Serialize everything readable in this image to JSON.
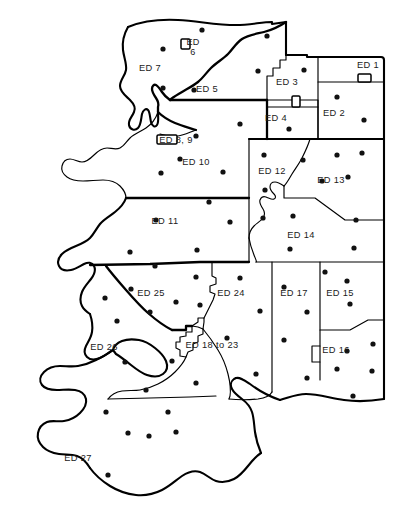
{
  "figure": {
    "type": "choropleth-outline-map",
    "width": 396,
    "height": 528,
    "background_color": "#ffffff",
    "line_color": "#000000",
    "dot_color": "#111111"
  },
  "districts": [
    {
      "id": "ed-1",
      "label": "ED 1",
      "label_x": 368,
      "label_y": 68,
      "has_inset_box": true,
      "box_x": 358,
      "box_y": 74,
      "box_w": 13,
      "box_h": 8
    },
    {
      "id": "ed-2",
      "label": "ED 2",
      "label_x": 334,
      "label_y": 116,
      "has_inset_box": false
    },
    {
      "id": "ed-3",
      "label": "ED 3",
      "label_x": 287,
      "label_y": 85,
      "has_inset_box": true,
      "box_x": 292,
      "box_y": 96,
      "box_w": 8,
      "box_h": 11
    },
    {
      "id": "ed-4",
      "label": "ED 4",
      "label_x": 276,
      "label_y": 121,
      "has_inset_box": false
    },
    {
      "id": "ed-5",
      "label": "ED 5",
      "label_x": 207,
      "label_y": 92,
      "has_inset_box": false
    },
    {
      "id": "ed-6",
      "label": "ED\n6",
      "label_x": 193,
      "label_y": 45,
      "has_inset_box": true,
      "box_x": 181,
      "box_y": 39,
      "box_w": 9,
      "box_h": 10
    },
    {
      "id": "ed-7",
      "label": "ED 7",
      "label_x": 150,
      "label_y": 71,
      "has_inset_box": false
    },
    {
      "id": "ed-8-9",
      "label": "ED 8, 9",
      "label_x": 176,
      "label_y": 143,
      "has_inset_box": true,
      "box_x": 157,
      "box_y": 135,
      "box_w": 20,
      "box_h": 9
    },
    {
      "id": "ed-10",
      "label": "ED 10",
      "label_x": 196,
      "label_y": 165,
      "has_inset_box": false
    },
    {
      "id": "ed-11",
      "label": "ED 11",
      "label_x": 165,
      "label_y": 224,
      "has_inset_box": false
    },
    {
      "id": "ed-12",
      "label": "ED 12",
      "label_x": 272,
      "label_y": 174,
      "has_inset_box": false
    },
    {
      "id": "ed-13",
      "label": "ED 13",
      "label_x": 331,
      "label_y": 183,
      "has_inset_box": false
    },
    {
      "id": "ed-14",
      "label": "ED 14",
      "label_x": 301,
      "label_y": 238,
      "has_inset_box": false
    },
    {
      "id": "ed-15",
      "label": "ED 15",
      "label_x": 340,
      "label_y": 296,
      "has_inset_box": false
    },
    {
      "id": "ed-16",
      "label": "ED 16",
      "label_x": 336,
      "label_y": 353,
      "has_inset_box": false
    },
    {
      "id": "ed-17",
      "label": "ED 17",
      "label_x": 294,
      "label_y": 296,
      "has_inset_box": false
    },
    {
      "id": "ed-18-23",
      "label": "ED 18 to 23",
      "label_x": 212,
      "label_y": 348,
      "has_inset_box": false
    },
    {
      "id": "ed-24",
      "label": "ED 24",
      "label_x": 231,
      "label_y": 296,
      "has_inset_box": false
    },
    {
      "id": "ed-25",
      "label": "ED 25",
      "label_x": 151,
      "label_y": 296,
      "has_inset_box": false
    },
    {
      "id": "ed-26",
      "label": "ED 26",
      "label_x": 104,
      "label_y": 350,
      "has_inset_box": false
    },
    {
      "id": "ed-27",
      "label": "ED 27",
      "label_x": 78,
      "label_y": 461,
      "has_inset_box": false
    }
  ],
  "settlement_dots": [
    {
      "x": 202,
      "y": 30
    },
    {
      "x": 267,
      "y": 36
    },
    {
      "x": 163,
      "y": 49
    },
    {
      "x": 258,
      "y": 71
    },
    {
      "x": 304,
      "y": 70
    },
    {
      "x": 163,
      "y": 88
    },
    {
      "x": 194,
      "y": 90
    },
    {
      "x": 337,
      "y": 97
    },
    {
      "x": 364,
      "y": 120
    },
    {
      "x": 289,
      "y": 129
    },
    {
      "x": 240,
      "y": 124
    },
    {
      "x": 196,
      "y": 136
    },
    {
      "x": 180,
      "y": 159
    },
    {
      "x": 223,
      "y": 172
    },
    {
      "x": 161,
      "y": 173
    },
    {
      "x": 264,
      "y": 155
    },
    {
      "x": 303,
      "y": 160
    },
    {
      "x": 337,
      "y": 155
    },
    {
      "x": 362,
      "y": 153
    },
    {
      "x": 265,
      "y": 190
    },
    {
      "x": 322,
      "y": 181
    },
    {
      "x": 348,
      "y": 177
    },
    {
      "x": 209,
      "y": 202
    },
    {
      "x": 156,
      "y": 220
    },
    {
      "x": 230,
      "y": 222
    },
    {
      "x": 263,
      "y": 218
    },
    {
      "x": 293,
      "y": 216
    },
    {
      "x": 356,
      "y": 220
    },
    {
      "x": 130,
      "y": 252
    },
    {
      "x": 197,
      "y": 250
    },
    {
      "x": 290,
      "y": 249
    },
    {
      "x": 354,
      "y": 248
    },
    {
      "x": 155,
      "y": 266
    },
    {
      "x": 240,
      "y": 278
    },
    {
      "x": 196,
      "y": 277
    },
    {
      "x": 325,
      "y": 272
    },
    {
      "x": 284,
      "y": 287
    },
    {
      "x": 347,
      "y": 281
    },
    {
      "x": 131,
      "y": 289
    },
    {
      "x": 105,
      "y": 298
    },
    {
      "x": 176,
      "y": 302
    },
    {
      "x": 200,
      "y": 305
    },
    {
      "x": 350,
      "y": 304
    },
    {
      "x": 150,
      "y": 312
    },
    {
      "x": 117,
      "y": 321
    },
    {
      "x": 260,
      "y": 311
    },
    {
      "x": 307,
      "y": 312
    },
    {
      "x": 227,
      "y": 338
    },
    {
      "x": 347,
      "y": 351
    },
    {
      "x": 373,
      "y": 344
    },
    {
      "x": 125,
      "y": 362
    },
    {
      "x": 172,
      "y": 361
    },
    {
      "x": 372,
      "y": 371
    },
    {
      "x": 337,
      "y": 369
    },
    {
      "x": 284,
      "y": 340
    },
    {
      "x": 256,
      "y": 374
    },
    {
      "x": 146,
      "y": 390
    },
    {
      "x": 196,
      "y": 383
    },
    {
      "x": 307,
      "y": 378
    },
    {
      "x": 353,
      "y": 396
    },
    {
      "x": 106,
      "y": 412
    },
    {
      "x": 168,
      "y": 412
    },
    {
      "x": 149,
      "y": 436
    },
    {
      "x": 128,
      "y": 433
    },
    {
      "x": 176,
      "y": 432
    },
    {
      "x": 108,
      "y": 475
    }
  ],
  "notes": {
    "dot_radius": 2.6,
    "dot_count": 66
  }
}
